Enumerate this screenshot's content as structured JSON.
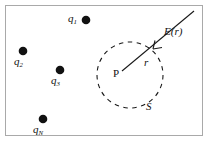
{
  "figure": {
    "type": "physics-diagram",
    "background_color": "#ffffff",
    "frame": {
      "stroke_color": "#a9a9a9",
      "x": 5,
      "y": 5,
      "width": 198,
      "height": 131
    },
    "gaussian_surface": {
      "label": "S",
      "center_label": "P",
      "radius_label": "r",
      "center_x": 130,
      "center_y": 75,
      "radius": 33,
      "stroke_color": "#1a1a1a",
      "dash": "4 4",
      "label_x": 147,
      "label_y": 102,
      "center_label_x": 113,
      "center_label_y": 68,
      "radius_label_x": 144,
      "radius_label_y": 58
    },
    "field_vector": {
      "label": "E(r)",
      "label_x": 165,
      "label_y": 27,
      "stroke_color": "#1a1a1a",
      "tail_x": 194,
      "tail_y": 11,
      "head_x": 153,
      "head_y": 49,
      "direction": "inward-pointing arrow at surface"
    },
    "charges": [
      {
        "label": "q",
        "subscript": "1",
        "dot_x": 86,
        "dot_y": 20,
        "dot_r": 4.3,
        "label_x": 69,
        "label_y": 14,
        "label_position": "left"
      },
      {
        "label": "q",
        "subscript": "2",
        "dot_x": 23,
        "dot_y": 51,
        "dot_r": 4.3,
        "label_x": 15,
        "label_y": 57,
        "label_position": "below"
      },
      {
        "label": "q",
        "subscript": "3",
        "dot_x": 60,
        "dot_y": 70,
        "dot_r": 4.3,
        "label_x": 52,
        "label_y": 76,
        "label_position": "below"
      },
      {
        "label": "q",
        "subscript": "N",
        "dot_x": 43,
        "dot_y": 119,
        "dot_r": 4.3,
        "label_x": 34,
        "label_y": 125,
        "label_position": "below"
      }
    ],
    "charge_color": "#111111"
  }
}
